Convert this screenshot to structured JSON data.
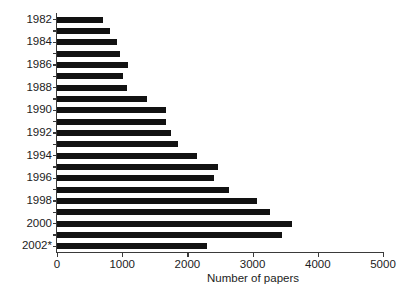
{
  "chart_data": {
    "type": "bar",
    "orientation": "horizontal",
    "title": "",
    "subtitle": "",
    "xlabel": "Number of papers",
    "ylabel": "",
    "xlim": [
      0,
      5000
    ],
    "xticks": [
      0,
      1000,
      2000,
      3000,
      4000,
      5000
    ],
    "xtick_labels": [
      "0",
      "1000",
      "2000",
      "3000",
      "4000",
      "5000"
    ],
    "grid": false,
    "legend": null,
    "bar_color": "#121212",
    "axis_color": "#3a3a3a",
    "categories": [
      "1982",
      "1983",
      "1984",
      "1985",
      "1986",
      "1987",
      "1988",
      "1989",
      "1990",
      "1991",
      "1992",
      "1993",
      "1994",
      "1995",
      "1996",
      "1997",
      "1998",
      "1999",
      "2000",
      "2001",
      "2002*"
    ],
    "ytick_labels": [
      "1982",
      "1984",
      "1986",
      "1988",
      "1990",
      "1992",
      "1994",
      "1996",
      "1998",
      "2000",
      "2002*"
    ],
    "values": [
      700,
      810,
      920,
      970,
      1090,
      1010,
      1080,
      1380,
      1670,
      1670,
      1750,
      1860,
      2150,
      2470,
      2410,
      2640,
      3070,
      3270,
      3600,
      3450,
      2300
    ],
    "annotations": [
      "* 2002 value is partial"
    ]
  },
  "axis": {
    "x_title": "Number of papers"
  }
}
